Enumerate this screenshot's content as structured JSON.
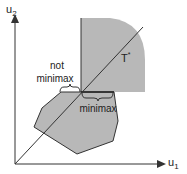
{
  "diagram": {
    "axes": {
      "y_label": "u",
      "y_sub": "2",
      "x_label": "u",
      "x_sub": "1"
    },
    "labels": {
      "t_star": "T",
      "t_star_sup": "*",
      "not_minimax_line1": "not",
      "not_minimax_line2": "minimax",
      "minimax": "minimax"
    },
    "colors": {
      "fill": "#b8b8b8",
      "stroke": "#333333"
    }
  }
}
